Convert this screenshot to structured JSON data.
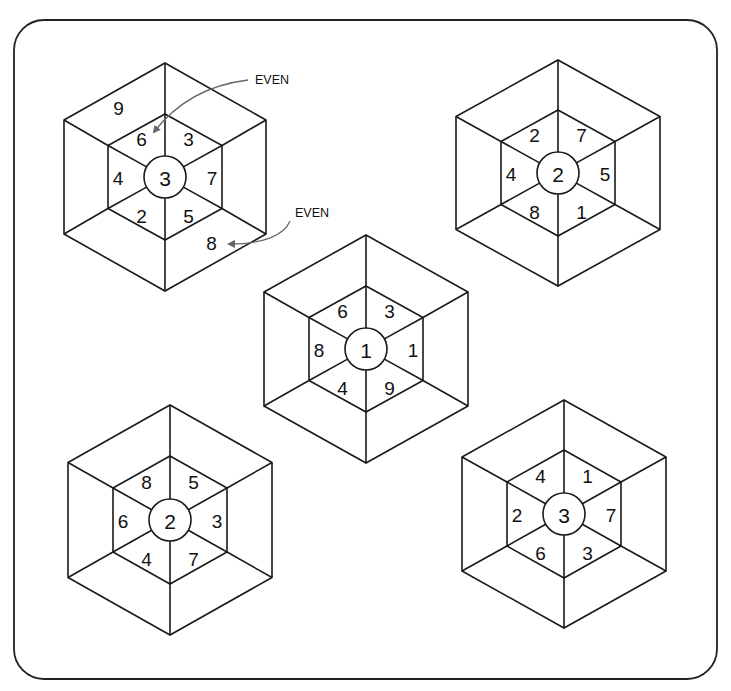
{
  "puzzle": {
    "frame": {
      "x": 14,
      "y": 20,
      "width": 703,
      "height": 659,
      "radius": 30
    },
    "hexagons": [
      {
        "id": "top-left",
        "center": [
          165,
          177
        ],
        "outer_radius": 114,
        "outer_halfwidth": 101,
        "inner_radius": 63,
        "inner_halfwidth": 57,
        "hub_radius": 21,
        "hub_value": "3",
        "inner_segments": {
          "top_left": "6",
          "top_right": "3",
          "right": "7",
          "bottom_right": "5",
          "bottom_left": "2",
          "left": "4"
        },
        "outer_segments": {
          "top_left": "9",
          "bottom_right": "8"
        }
      },
      {
        "id": "top-right",
        "center": [
          558,
          173
        ],
        "outer_radius": 113,
        "outer_halfwidth": 102,
        "inner_radius": 63,
        "inner_halfwidth": 57,
        "hub_radius": 21,
        "hub_value": "2",
        "inner_segments": {
          "top_left": "2",
          "top_right": "7",
          "right": "5",
          "bottom_right": "1",
          "bottom_left": "8",
          "left": "4"
        },
        "outer_segments": {}
      },
      {
        "id": "center",
        "center": [
          366,
          349
        ],
        "outer_radius": 114,
        "outer_halfwidth": 102,
        "inner_radius": 63,
        "inner_halfwidth": 57,
        "hub_radius": 21,
        "hub_value": "1",
        "inner_segments": {
          "top_left": "6",
          "top_right": "3",
          "right": "1",
          "bottom_right": "9",
          "bottom_left": "4",
          "left": "8"
        },
        "outer_segments": {}
      },
      {
        "id": "bottom-left",
        "center": [
          170,
          520
        ],
        "outer_radius": 115,
        "outer_halfwidth": 102,
        "inner_radius": 64,
        "inner_halfwidth": 57,
        "hub_radius": 21,
        "hub_value": "2",
        "inner_segments": {
          "top_left": "8",
          "top_right": "5",
          "right": "3",
          "bottom_right": "7",
          "bottom_left": "4",
          "left": "6"
        },
        "outer_segments": {}
      },
      {
        "id": "bottom-right",
        "center": [
          564,
          514
        ],
        "outer_radius": 114,
        "outer_halfwidth": 102,
        "inner_radius": 64,
        "inner_halfwidth": 57,
        "hub_radius": 21,
        "hub_value": "3",
        "inner_segments": {
          "top_left": "4",
          "top_right": "1",
          "right": "7",
          "bottom_right": "3",
          "bottom_left": "6",
          "left": "2"
        },
        "outer_segments": {}
      }
    ],
    "annotations": [
      {
        "text": "EVEN",
        "x": 255,
        "y": 84,
        "points_to": "top-left hexagon inner segment 6"
      },
      {
        "text": "EVEN",
        "x": 295,
        "y": 217,
        "points_to": "top-left hexagon outer segment 8"
      }
    ]
  }
}
